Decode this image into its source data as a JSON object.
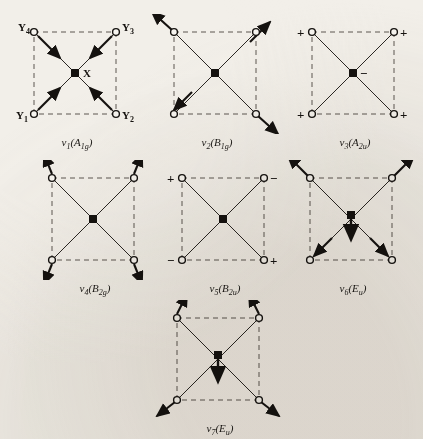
{
  "figure": {
    "background_color": "#f2efe9",
    "ink_color": "#15120f",
    "dashed_color": "#5c5650",
    "central_atom_label": "X",
    "ligand_labels": [
      "Y1",
      "Y2",
      "Y3",
      "Y4"
    ],
    "ligand_label_text": {
      "top_left": "Y",
      "top_left_sub": "4",
      "top_right": "Y",
      "top_right_sub": "3",
      "bottom_left": "Y",
      "bottom_left_sub": "1",
      "bottom_right": "Y",
      "bottom_right_sub": "2"
    }
  },
  "modes": [
    {
      "id": "v1",
      "nu": "ν",
      "index": "1",
      "symmetry": "A",
      "symmetry_sub": "1g",
      "label_plain": "ν1(A1g)",
      "description": "symmetric stretch, all ligands move inward along the diagonals toward X",
      "show_atom_labels": true,
      "show_center_label": true,
      "arrow_style": "in-plane-radial-inward",
      "signs": [],
      "center_arrow": "none"
    },
    {
      "id": "v2",
      "nu": "ν",
      "index": "2",
      "symmetry": "B",
      "symmetry_sub": "1g",
      "label_plain": "ν2(B1g)",
      "description": "out-of-phase stretch, opposite ligand pairs move outward along the diagonals",
      "show_atom_labels": false,
      "show_center_label": false,
      "arrow_style": "in-plane-radial-outward",
      "signs": [],
      "center_arrow": "none"
    },
    {
      "id": "v3",
      "nu": "ν",
      "index": "3",
      "symmetry": "A",
      "symmetry_sub": "2u",
      "label_plain": "ν3(A2u)",
      "description": "out-of-plane mode, all four ligands move up (+) while X moves down (-)",
      "show_atom_labels": false,
      "show_center_label": false,
      "arrow_style": "none",
      "signs": [
        {
          "position": "top-left",
          "sign": "+"
        },
        {
          "position": "top-right",
          "sign": "+"
        },
        {
          "position": "bottom-left",
          "sign": "+"
        },
        {
          "position": "bottom-right",
          "sign": "+"
        }
      ],
      "center_sign": "−",
      "center_arrow": "none"
    },
    {
      "id": "v4",
      "nu": "ν",
      "index": "4",
      "symmetry": "B",
      "symmetry_sub": "2g",
      "label_plain": "ν4(B2g)",
      "description": "in-plane bend, ligands move tangentially outward perpendicular to the diagonals",
      "show_atom_labels": false,
      "show_center_label": false,
      "arrow_style": "in-plane-tangential",
      "signs": [],
      "center_arrow": "none"
    },
    {
      "id": "v5",
      "nu": "ν",
      "index": "5",
      "symmetry": "B",
      "symmetry_sub": "2u",
      "label_plain": "ν5(B2u)",
      "description": "out-of-plane bend with alternating phases around the square",
      "show_atom_labels": false,
      "show_center_label": false,
      "arrow_style": "none",
      "signs": [
        {
          "position": "top-left",
          "sign": "+"
        },
        {
          "position": "top-right",
          "sign": "−"
        },
        {
          "position": "bottom-left",
          "sign": "−"
        },
        {
          "position": "bottom-right",
          "sign": "+"
        }
      ],
      "center_sign": "",
      "center_arrow": "none"
    },
    {
      "id": "v6",
      "nu": "ν",
      "index": "6",
      "symmetry": "E",
      "symmetry_sub": "u",
      "label_plain": "ν6(Eu)",
      "description": "degenerate asymmetric stretch, ligands move outward along diagonals while X moves down",
      "show_atom_labels": false,
      "show_center_label": false,
      "arrow_style": "in-plane-radial-outward",
      "signs": [],
      "center_arrow": "down"
    },
    {
      "id": "v7",
      "nu": "ν",
      "index": "7",
      "symmetry": "E",
      "symmetry_sub": "u",
      "label_plain": "ν7(Eu)",
      "description": "degenerate in-plane bend, top ligands move up and bottom ligands move outward while X moves down",
      "show_atom_labels": false,
      "show_center_label": false,
      "arrow_style": "tangential-updown",
      "signs": [],
      "center_arrow": "down"
    }
  ]
}
